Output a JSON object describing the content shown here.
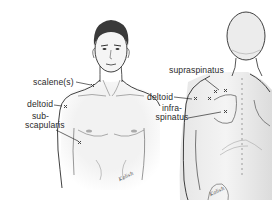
{
  "diagram": {
    "title": "",
    "views": [
      {
        "id": "front",
        "description": "Anterior view of male upper torso and head",
        "labels": [
          {
            "text": "scalene(s)",
            "target": "neck-base"
          },
          {
            "text": "deltoid",
            "target": "front-shoulder"
          },
          {
            "line1": "sub-",
            "line2": "scapularis",
            "target": "armpit"
          }
        ],
        "markers": 3
      },
      {
        "id": "back",
        "description": "Posterior view of male upper back and head",
        "labels": [
          {
            "text": "supraspinatus",
            "target": "upper-scapula"
          },
          {
            "text": "deltoid",
            "target": "rear-shoulder"
          },
          {
            "line1": "infra-",
            "line2": "spinatus",
            "target": "scapula-body"
          }
        ],
        "markers": 5
      }
    ],
    "marker_symbol": "x",
    "signature": "Kalish",
    "colors": {
      "line": "#2b2b2b",
      "shade": "#d8d8d8",
      "skin": "#f3f3f3",
      "hair": "#3a3a3a",
      "marker": "#444444"
    }
  }
}
